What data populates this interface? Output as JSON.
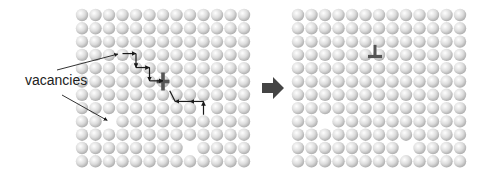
{
  "figure": {
    "label_vacancies": "vacancies",
    "colors": {
      "sphere_highlight": "#ffffff",
      "sphere_mid": "#dcdcdc",
      "sphere_shadow": "#a8a8a8",
      "path_arrows": "#1a1a1a",
      "dislocation_symbol": "#555555",
      "transition_arrow": "#444444",
      "pointer_lines": "#333333"
    },
    "lattice_before": {
      "name": "before",
      "rows": 12,
      "cols": 13,
      "vacancies": [
        [
          7,
          9
        ],
        [
          8,
          2
        ],
        [
          10,
          8
        ]
      ],
      "dislocation": {
        "symbol": "cross",
        "row": 5,
        "col": 6
      },
      "vacancy_path": [
        {
          "from": [
            2.9,
            3
          ],
          "to": [
            2.9,
            4
          ],
          "dir": "right"
        },
        {
          "from": [
            2.9,
            4
          ],
          "to": [
            3.95,
            4
          ],
          "dir": "down"
        },
        {
          "from": [
            3.95,
            4
          ],
          "to": [
            3.95,
            5
          ],
          "dir": "right"
        },
        {
          "from": [
            3.95,
            5
          ],
          "to": [
            4.95,
            5
          ],
          "dir": "down"
        },
        {
          "from": [
            4.95,
            5
          ],
          "to": [
            4.95,
            6
          ],
          "dir": "right"
        },
        {
          "from": [
            5.7,
            6.5
          ],
          "to": [
            6.5,
            6.9
          ],
          "dir": "none"
        },
        {
          "from": [
            6.5,
            8
          ],
          "to": [
            6.5,
            6.9
          ],
          "dir": "left"
        },
        {
          "from": [
            6.5,
            9
          ],
          "to": [
            6.5,
            8
          ],
          "dir": "left"
        },
        {
          "from": [
            7.5,
            9
          ],
          "to": [
            6.5,
            9
          ],
          "dir": "up"
        }
      ],
      "pointers": [
        {
          "target": [
            2.9,
            2.8
          ]
        },
        {
          "target": [
            8,
            2
          ]
        }
      ]
    },
    "transition_arrow": "right-arrow",
    "lattice_after": {
      "name": "after",
      "rows": 12,
      "cols": 13,
      "vacancies": [
        [
          8,
          2
        ],
        [
          10,
          8
        ]
      ],
      "dislocation": {
        "symbol": "edge-dislocation-perp",
        "row": 3,
        "col": 6
      }
    }
  }
}
